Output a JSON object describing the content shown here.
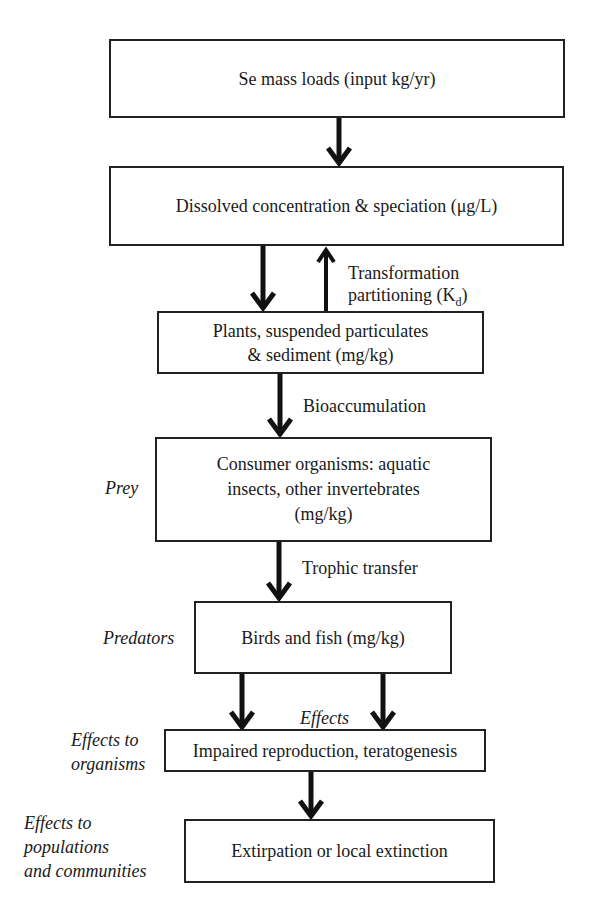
{
  "boxes": {
    "mass_loads": "Se mass loads (input kg/yr)",
    "dissolved": "Dissolved concentration & speciation (μg/L)",
    "plants_line1": "Plants, suspended particulates",
    "plants_line2": "& sediment (mg/kg)",
    "consumer_line1": "Consumer organisms: aquatic",
    "consumer_line2": "insects, other invertebrates",
    "consumer_line3": "(mg/kg)",
    "birds_fish": "Birds and fish (mg/kg)",
    "impaired": "Impaired reproduction, teratogenesis",
    "extirpation": "Extirpation or local extinction"
  },
  "edge_labels": {
    "transformation_line1": "Transformation",
    "transformation_line2": "partitioning (K",
    "transformation_sub": "d",
    "transformation_close": ")",
    "bioaccumulation": "Bioaccumulation",
    "trophic": "Trophic transfer",
    "effects": "Effects"
  },
  "side_labels": {
    "prey": "Prey",
    "predators": "Predators",
    "effects_organisms_1": "Effects to",
    "effects_organisms_2": "organisms",
    "effects_pop_1": "Effects to",
    "effects_pop_2": "populations",
    "effects_pop_3": "and communities"
  }
}
